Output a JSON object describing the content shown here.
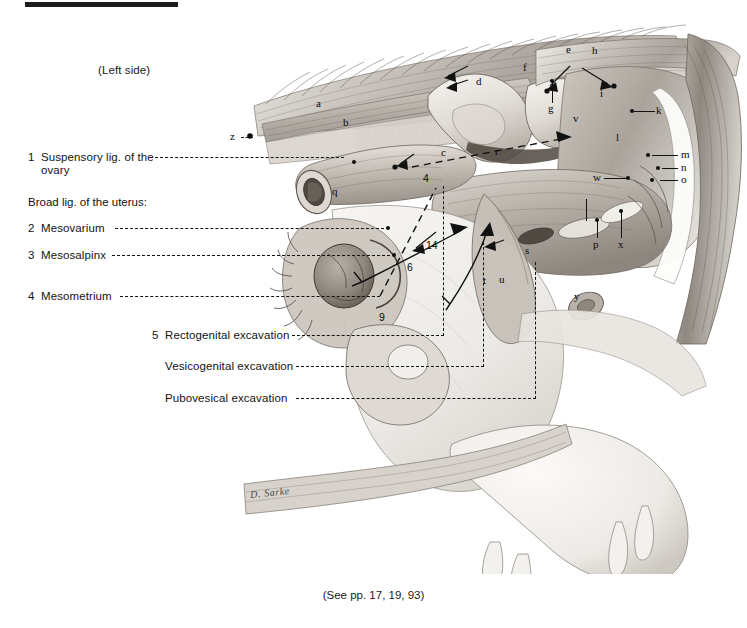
{
  "plate": {
    "side_note": "(Left side)",
    "caption": "(See pp. 17, 19, 93)",
    "signature": "D. Sarke"
  },
  "legend": {
    "numbered": [
      {
        "num": "1",
        "label": "Suspensory lig. of the",
        "label2": "ovary"
      },
      {
        "num": "2",
        "label": "Mesovarium"
      },
      {
        "num": "3",
        "label": "Mesosalpinx"
      },
      {
        "num": "4",
        "label": "Mesometrium"
      },
      {
        "num": "5",
        "label": "Rectogenital excavation"
      }
    ],
    "group_heading": "Broad lig. of the uterus:",
    "unnumbered": [
      {
        "label": "Vesicogenital excavation"
      },
      {
        "label": "Pubovesical excavation"
      }
    ]
  },
  "callouts": [
    {
      "id": "z",
      "text": "z"
    },
    {
      "id": "a",
      "text": "a"
    },
    {
      "id": "b",
      "text": "b"
    },
    {
      "id": "c",
      "text": "c"
    },
    {
      "id": "d",
      "text": "d"
    },
    {
      "id": "e",
      "text": "e"
    },
    {
      "id": "f",
      "text": "f"
    },
    {
      "id": "g",
      "text": "g"
    },
    {
      "id": "h",
      "text": "h"
    },
    {
      "id": "i",
      "text": "i"
    },
    {
      "id": "k",
      "text": "k"
    },
    {
      "id": "l",
      "text": "l"
    },
    {
      "id": "m",
      "text": "m"
    },
    {
      "id": "n",
      "text": "n"
    },
    {
      "id": "o",
      "text": "o"
    },
    {
      "id": "p",
      "text": "p"
    },
    {
      "id": "q",
      "text": "q"
    },
    {
      "id": "r",
      "text": "r"
    },
    {
      "id": "s",
      "text": "s"
    },
    {
      "id": "t",
      "text": "t"
    },
    {
      "id": "u",
      "text": "u"
    },
    {
      "id": "v",
      "text": "v"
    },
    {
      "id": "w",
      "text": "w"
    },
    {
      "id": "x",
      "text": "x"
    },
    {
      "id": "y",
      "text": "y"
    },
    {
      "id": "num4",
      "text": "4"
    },
    {
      "id": "num6",
      "text": "6"
    },
    {
      "id": "num9",
      "text": "9"
    },
    {
      "id": "num14",
      "text": "14"
    }
  ],
  "colors": {
    "ink": "#121212",
    "rule": "#1c1c1c",
    "paper": "#ffffff"
  }
}
